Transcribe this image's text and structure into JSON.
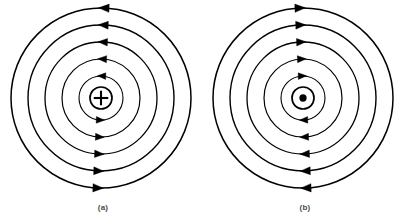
{
  "figure": {
    "background_color": "#ffffff",
    "stroke_color": "#000000",
    "caption_color": "#4a4a4a",
    "width": 403,
    "height": 224
  },
  "panels": [
    {
      "id": "a",
      "caption": "(a)",
      "center": {
        "x": 101,
        "y": 98
      },
      "current_symbol": "cross-in-circle-icon",
      "current_symbol_glyph": "+",
      "current_direction": "into-page",
      "field_direction": "clockwise",
      "symbol_radius": 11,
      "ring_radii": [
        22,
        39,
        56,
        73,
        90
      ],
      "arrow_angles_deg": [
        272,
        92
      ],
      "stroke_widths": [
        1.1,
        1.2,
        1.3,
        1.4,
        1.5
      ]
    },
    {
      "id": "b",
      "caption": "(b)",
      "center": {
        "x": 303,
        "y": 98
      },
      "current_symbol": "dot-in-circle-icon",
      "current_symbol_glyph": "•",
      "current_direction": "out-of-page",
      "field_direction": "counterclockwise",
      "symbol_radius": 11,
      "ring_radii": [
        22,
        39,
        56,
        73,
        90
      ],
      "arrow_angles_deg": [
        268,
        88
      ],
      "stroke_widths": [
        1.1,
        1.2,
        1.3,
        1.4,
        1.5
      ]
    }
  ],
  "chart_data": {
    "type": "diagram",
    "title": "",
    "subtitle": "",
    "panels": [
      {
        "label": "(a)",
        "center_symbol": "plus-in-circle",
        "meaning": "current into the page",
        "circulation": "clockwise",
        "num_field_circles": 5,
        "circle_radii_px": [
          22,
          39,
          56,
          73,
          90
        ],
        "arrowheads_per_circle": 2,
        "arrow_positions": [
          "top",
          "bottom"
        ],
        "top_arrow_points": "right",
        "bottom_arrow_points": "left"
      },
      {
        "label": "(b)",
        "center_symbol": "dot-in-circle",
        "meaning": "current out of the page",
        "circulation": "counterclockwise",
        "num_field_circles": 5,
        "circle_radii_px": [
          22,
          39,
          56,
          73,
          90
        ],
        "arrowheads_per_circle": 2,
        "arrow_positions": [
          "top",
          "bottom"
        ],
        "top_arrow_points": "left",
        "bottom_arrow_points": "right"
      }
    ],
    "xlabel": "",
    "ylabel": "",
    "legend": [],
    "grid": false
  }
}
